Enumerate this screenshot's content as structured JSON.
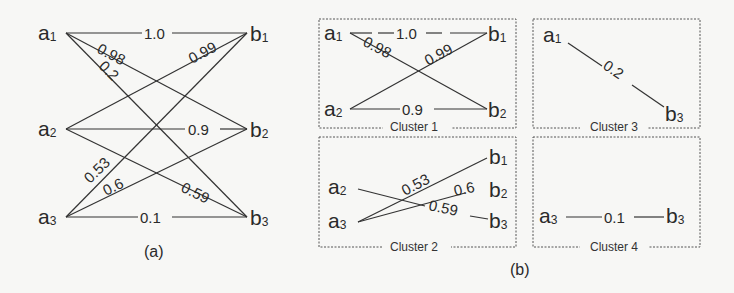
{
  "panel_a": {
    "caption": "(a)",
    "left_nodes": [
      {
        "base": "a",
        "sub": "1"
      },
      {
        "base": "a",
        "sub": "2"
      },
      {
        "base": "a",
        "sub": "3"
      }
    ],
    "right_nodes": [
      {
        "base": "b",
        "sub": "1"
      },
      {
        "base": "b",
        "sub": "2"
      },
      {
        "base": "b",
        "sub": "3"
      }
    ],
    "edges": [
      {
        "from": "a1",
        "to": "b1",
        "weight": "1.0"
      },
      {
        "from": "a1",
        "to": "b2",
        "weight": "0.98"
      },
      {
        "from": "a1",
        "to": "b3",
        "weight": "0.2"
      },
      {
        "from": "a2",
        "to": "b1",
        "weight": "0.99"
      },
      {
        "from": "a2",
        "to": "b2",
        "weight": "0.9"
      },
      {
        "from": "a2",
        "to": "b3",
        "weight": "0.59"
      },
      {
        "from": "a3",
        "to": "b1",
        "weight": "0.53"
      },
      {
        "from": "a3",
        "to": "b2",
        "weight": "0.6"
      },
      {
        "from": "a3",
        "to": "b3",
        "weight": "0.1"
      }
    ]
  },
  "panel_b": {
    "caption": "(b)",
    "clusters": [
      {
        "label": "Cluster 1",
        "edges": [
          {
            "from": "a1",
            "to": "b1",
            "weight": "1.0"
          },
          {
            "from": "a1",
            "to": "b2",
            "weight": "0.98"
          },
          {
            "from": "a2",
            "to": "b1",
            "weight": "0.99"
          },
          {
            "from": "a2",
            "to": "b2",
            "weight": "0.9"
          }
        ]
      },
      {
        "label": "Cluster 2",
        "edges": [
          {
            "from": "a3",
            "to": "b1",
            "weight": "0.53"
          },
          {
            "from": "a3",
            "to": "b2",
            "weight": "0.6"
          },
          {
            "from": "a2",
            "to": "b3",
            "weight": "0.59"
          }
        ]
      },
      {
        "label": "Cluster 3",
        "edges": [
          {
            "from": "a1",
            "to": "b3",
            "weight": "0.2"
          }
        ]
      },
      {
        "label": "Cluster 4",
        "edges": [
          {
            "from": "a3",
            "to": "b3",
            "weight": "0.1"
          }
        ]
      }
    ]
  }
}
